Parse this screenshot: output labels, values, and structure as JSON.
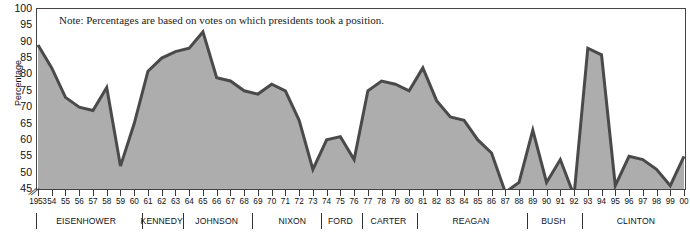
{
  "chart_data": {
    "type": "area",
    "title": "",
    "note": "Note: Percentages are based on votes on which presidents took a position.",
    "xlabel": "",
    "ylabel": "Percentage",
    "ylim": [
      45,
      100
    ],
    "ytick_values": [
      100,
      95,
      90,
      85,
      80,
      75,
      70,
      65,
      60,
      55,
      50,
      45
    ],
    "grid": false,
    "legend": "none",
    "axis_break": true,
    "series_name": "Presidential success rate",
    "x": [
      1953,
      1954,
      1955,
      1956,
      1957,
      1958,
      1959,
      1960,
      1961,
      1962,
      1963,
      1964,
      1965,
      1966,
      1967,
      1968,
      1969,
      1970,
      1971,
      1972,
      1973,
      1974,
      1975,
      1976,
      1977,
      1978,
      1979,
      1980,
      1981,
      1982,
      1983,
      1984,
      1985,
      1986,
      1987,
      1988,
      1989,
      1990,
      1991,
      1992,
      1993,
      1994,
      1995,
      1996,
      1997,
      1998,
      1999,
      2000
    ],
    "x_tick_labels": [
      "1953",
      "54",
      "55",
      "56",
      "57",
      "58",
      "59",
      "60",
      "61",
      "62",
      "63",
      "64",
      "65",
      "66",
      "67",
      "68",
      "69",
      "70",
      "71",
      "72",
      "73",
      "74",
      "75",
      "76",
      "77",
      "78",
      "79",
      "80",
      "81",
      "82",
      "83",
      "84",
      "85",
      "86",
      "87",
      "88",
      "89",
      "90",
      "91",
      "92",
      "93",
      "94",
      "95",
      "96",
      "97",
      "98",
      "99",
      "00"
    ],
    "values": [
      89.0,
      82.0,
      73.0,
      70.0,
      69.0,
      76.0,
      52.0,
      65.0,
      81.0,
      85.0,
      87.0,
      88.0,
      93.0,
      79.0,
      78.0,
      75.0,
      74.0,
      77.0,
      75.0,
      66.0,
      51.0,
      60.0,
      61.0,
      54.0,
      75.0,
      78.0,
      77.0,
      75.0,
      82.0,
      72.0,
      67.0,
      66.0,
      60.0,
      56.0,
      44.0,
      47.0,
      63.0,
      47.0,
      54.0,
      43.0,
      88.0,
      86.0,
      46.0,
      55.0,
      54.0,
      51.0,
      46.0,
      55.0
    ],
    "presidents": [
      {
        "name": "EISENHOWER",
        "start_year": 1953,
        "end_year": 1960
      },
      {
        "name": "KENNEDY",
        "start_year": 1961,
        "end_year": 1963
      },
      {
        "name": "JOHNSON",
        "start_year": 1964,
        "end_year": 1968
      },
      {
        "name": "NIXON",
        "start_year": 1969,
        "end_year": 1974
      },
      {
        "name": "FORD",
        "start_year": 1974,
        "end_year": 1976
      },
      {
        "name": "CARTER",
        "start_year": 1977,
        "end_year": 1980
      },
      {
        "name": "REAGAN",
        "start_year": 1981,
        "end_year": 1988
      },
      {
        "name": "BUSH",
        "start_year": 1989,
        "end_year": 1992
      },
      {
        "name": "CLINTON",
        "start_year": 1993,
        "end_year": 2000
      }
    ],
    "colors": {
      "area_fill": "#adadad",
      "line": "#4a4a4a",
      "axis": "#444444",
      "text": "#111111",
      "plot_background": "#ffffff"
    }
  }
}
